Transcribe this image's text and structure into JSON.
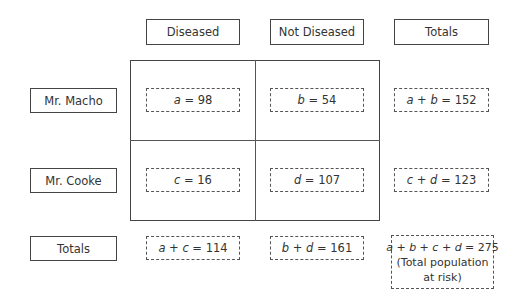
{
  "columns": {
    "diseased": "Diseased",
    "not_diseased": "Not Diseased",
    "totals": "Totals"
  },
  "rows": {
    "macho": "Mr. Macho",
    "cooke": "Mr. Cooke",
    "totals": "Totals"
  },
  "cells": {
    "a": {
      "var": "a",
      "eq": " = 98"
    },
    "b": {
      "var": "b",
      "eq": " = 54"
    },
    "c": {
      "var": "c",
      "eq": " = 16"
    },
    "d": {
      "var": "d",
      "eq": " = 107"
    }
  },
  "row_totals": {
    "macho": {
      "v1": "a",
      "op": " + ",
      "v2": "b",
      "eq": " = 152"
    },
    "cooke": {
      "v1": "c",
      "op": " + ",
      "v2": "d",
      "eq": " = 123"
    }
  },
  "col_totals": {
    "diseased": {
      "v1": "a",
      "op": " + ",
      "v2": "c",
      "eq": " = 114"
    },
    "not_diseased": {
      "v1": "b",
      "op": " + ",
      "v2": "d",
      "eq": " = 161"
    }
  },
  "grand_total": {
    "v1": "a",
    "v2": "b",
    "v3": "c",
    "v4": "d",
    "op": " + ",
    "eq": " = 275",
    "note_line1": "(Total population",
    "note_line2": "at risk)"
  }
}
